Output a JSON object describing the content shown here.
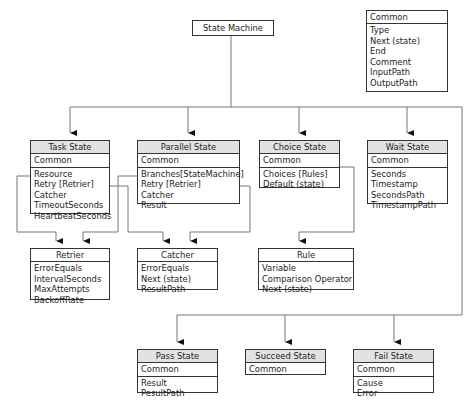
{
  "root": {
    "label": "State Machine"
  },
  "common_box": {
    "title": "Common",
    "fields": [
      "Type",
      "Next (state)",
      "End",
      "Comment",
      "InputPath",
      "OutputPath"
    ]
  },
  "states": {
    "task": {
      "title": "Task State",
      "common": "Common",
      "fields": [
        "Resource",
        "Retry [Retrier]",
        "Catcher",
        "TimeoutSeconds",
        "HeartbeatSeconds"
      ]
    },
    "parallel": {
      "title": "Parallel State",
      "common": "Common",
      "fields": [
        "Branches[StateMachine]",
        "Retry [Retrier]",
        "Catcher",
        "Result"
      ]
    },
    "choice": {
      "title": "Choice State",
      "common": "Common",
      "fields": [
        "Choices [Rules]",
        "Default (state)"
      ]
    },
    "wait": {
      "title": "Wait State",
      "common": "Common",
      "fields": [
        "Seconds",
        "Timestamp",
        "SecondsPath",
        "TimestampPath"
      ]
    },
    "pass": {
      "title": "Pass State",
      "common": "Common",
      "fields": [
        "Result",
        "PesultPath"
      ]
    },
    "succeed": {
      "title": "Succeed State",
      "common": "Common",
      "fields": []
    },
    "fail": {
      "title": "Fail State",
      "common": "Common",
      "fields": [
        "Cause",
        "Error"
      ]
    }
  },
  "helpers": {
    "retrier": {
      "title": "Retrier",
      "fields": [
        "ErrorEquals",
        "IntervalSeconds",
        "MaxAttempts",
        "BackoffRate"
      ]
    },
    "catcher": {
      "title": "Catcher",
      "fields": [
        "ErrorEquals",
        "Next (state)",
        "ResultPath"
      ]
    },
    "rule": {
      "title": "Rule",
      "fields": [
        "Variable",
        "Comparison Operator",
        "Next (state)"
      ]
    }
  },
  "colors": {
    "line": "#777777",
    "border": "#333333",
    "header_bg": "#e2e2e2"
  }
}
